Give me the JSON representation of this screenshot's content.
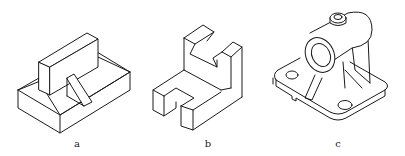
{
  "figures": [
    {
      "id": "a",
      "caption": "a",
      "description": "Rectangular base block with upright block and triangular rib"
    },
    {
      "id": "b",
      "caption": "b",
      "description": "L-shaped block with V-notch on top and slot in base"
    },
    {
      "id": "c",
      "caption": "c",
      "description": "Bearing bracket with cylindrical boss, rib supports and base plate with two holes"
    }
  ],
  "colors": {
    "line": "#1a1a1a",
    "background": "#ffffff"
  }
}
